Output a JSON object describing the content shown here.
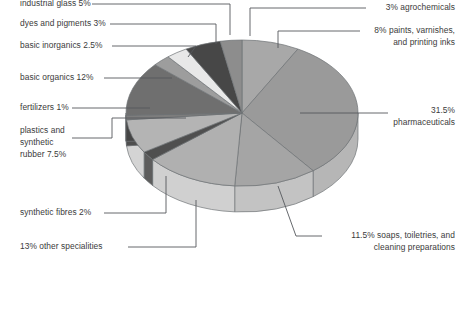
{
  "chart_data": {
    "type": "pie",
    "title": "",
    "legend_position": "callout-labels",
    "grid": false,
    "three_d": true,
    "units": "percent",
    "total": 100,
    "start_angle_deg": -90,
    "direction": "clockwise",
    "categories": [
      "paints, varnishes, and printing inks",
      "pharmaceuticals",
      "soaps, toiletries, and cleaning preparations",
      "other specialities",
      "synthetic fibres",
      "plastics and synthetic rubber",
      "fertilizers",
      "basic organics",
      "basic inorganics",
      "dyes and pigments",
      "industrial glass",
      "agrochemicals"
    ],
    "values": [
      8,
      31.5,
      11.5,
      13,
      2,
      7.5,
      1,
      12,
      2.5,
      3,
      5,
      3
    ],
    "slice_colors": [
      "#a8a8a8",
      "#9a9a9a",
      "#a5a5a5",
      "#b0b0b0",
      "#4f4f4f",
      "#b4b4b4",
      "#7d7d7d",
      "#6f6f6f",
      "#9d9d9d",
      "#e8e8e8",
      "#474747",
      "#8d8d8d"
    ],
    "labels": [
      {
        "id": "industrial-glass",
        "text": "industrial glass 5%",
        "value": 5,
        "side": "left",
        "x": 20,
        "y": 6,
        "lines": [
          "industrial glass 5%"
        ]
      },
      {
        "id": "dyes-pigments",
        "text": "dyes and pigments 3%",
        "value": 3,
        "side": "left",
        "x": 20,
        "y": 26,
        "lines": [
          "dyes and pigments 3%"
        ]
      },
      {
        "id": "basic-inorganics",
        "text": "basic inorganics 2.5%",
        "value": 2.5,
        "side": "left",
        "x": 20,
        "y": 48,
        "lines": [
          "basic inorganics 2.5%"
        ]
      },
      {
        "id": "basic-organics",
        "text": "basic organics 12%",
        "value": 12,
        "side": "left",
        "x": 20,
        "y": 80,
        "lines": [
          "basic organics 12%"
        ]
      },
      {
        "id": "fertilizers",
        "text": "fertilizers 1%",
        "value": 1,
        "side": "left",
        "x": 20,
        "y": 110,
        "lines": [
          "fertilizers 1%"
        ]
      },
      {
        "id": "plastics-rubber",
        "text": "plastics and synthetic rubber 7.5%",
        "value": 7.5,
        "side": "left",
        "x": 20,
        "y": 133,
        "lines": [
          "plastics and",
          "synthetic",
          "rubber 7.5%"
        ]
      },
      {
        "id": "synthetic-fibres",
        "text": "synthetic fibres 2%",
        "value": 2,
        "side": "left",
        "x": 20,
        "y": 215,
        "lines": [
          "synthetic fibres 2%"
        ]
      },
      {
        "id": "other-specialities",
        "text": "13% other specialities",
        "value": 13,
        "side": "left",
        "x": 20,
        "y": 249,
        "lines": [
          "13% other specialities"
        ]
      },
      {
        "id": "agrochemicals",
        "text": "3% agrochemicals",
        "value": 3,
        "side": "right",
        "x": 455,
        "y": 10,
        "lines": [
          "3% agrochemicals"
        ]
      },
      {
        "id": "paints-varnishes",
        "text": "8% paints, varnishes, and printing inks",
        "value": 8,
        "side": "right",
        "x": 455,
        "y": 33,
        "lines": [
          "8% paints, varnishes,",
          "and printing inks"
        ]
      },
      {
        "id": "pharmaceuticals",
        "text": "31.5% pharmaceuticals",
        "value": 31.5,
        "side": "right",
        "x": 455,
        "y": 113,
        "lines": [
          "31.5%",
          "pharmaceuticals"
        ]
      },
      {
        "id": "soaps-toiletries",
        "text": "11.5% soaps, toiletries, and cleaning preparations",
        "value": 11.5,
        "side": "right",
        "x": 455,
        "y": 238,
        "lines": [
          "11.5% soaps, toiletries, and",
          "cleaning preparations"
        ]
      }
    ]
  },
  "colors": {
    "background": "#ffffff",
    "text": "#3b3b3b",
    "leader": "#55585c",
    "rim_light": "#d2d2d2",
    "rim_dark": "#4a4a4a",
    "outline": "#6e7276"
  }
}
